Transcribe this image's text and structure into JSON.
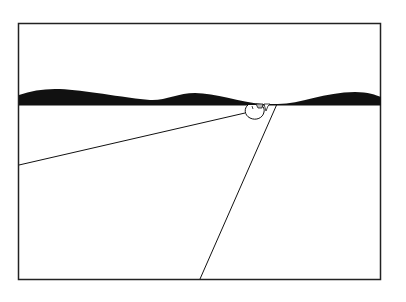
{
  "illustration": {
    "description": "Line drawing of a horizon with wavy dark water band, a small figure at the surface, and two lines diverging from it",
    "colors": {
      "background": "#ffffff",
      "ink": "#111111",
      "frame": "#222222"
    },
    "frame": {
      "x": 18,
      "y": 23,
      "width": 363,
      "height": 257
    },
    "horizon_y": 105,
    "wave_band": {
      "crests": [
        {
          "x": 55,
          "y": 89
        },
        {
          "x": 195,
          "y": 93
        },
        {
          "x": 355,
          "y": 92
        }
      ],
      "troughs": [
        {
          "x": 150,
          "y": 100
        },
        {
          "x": 278,
          "y": 104
        }
      ]
    },
    "figure": {
      "cx": 256,
      "cy": 111,
      "label": "figure-at-surface"
    },
    "lines": [
      {
        "name": "left-line",
        "x1": 245,
        "y1": 113,
        "x2": 19,
        "y2": 165
      },
      {
        "name": "right-line",
        "x1": 277,
        "y1": 104,
        "x2": 200,
        "y2": 279
      }
    ]
  }
}
